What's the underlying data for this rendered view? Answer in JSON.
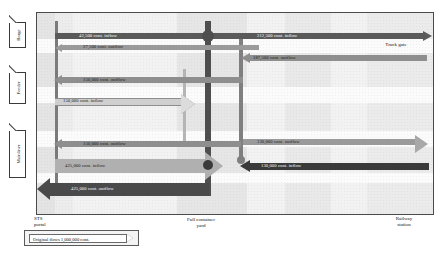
{
  "diagram": {
    "modes": [
      {
        "label": "Barge",
        "name": "barge"
      },
      {
        "label": "Feeder",
        "name": "feeder"
      },
      {
        "label": "Mainliner",
        "name": "mainliner"
      }
    ],
    "zones": [
      {
        "name": "sts-portal",
        "line1": "STS",
        "line2": "portal"
      },
      {
        "name": "full-container-yard",
        "line1": "Full container",
        "line2": "yard"
      },
      {
        "name": "truck-gate",
        "line1": "Truck gate",
        "line2": ""
      },
      {
        "name": "railway-station",
        "line1": "Railway",
        "line2": "station"
      }
    ],
    "flows": [
      {
        "name": "barge-inflow",
        "label": "42,500 cont. inflow",
        "value": 42500,
        "direction": "inflow",
        "mode": "Barge",
        "color": "#5a5a5a"
      },
      {
        "name": "barge-outflow",
        "label": "27,500 cont. outflow",
        "value": 27500,
        "direction": "outflow",
        "mode": "Barge",
        "color": "#9a9a9a"
      },
      {
        "name": "feeder-outflow",
        "label": "150,000 cont. outflow",
        "value": 150000,
        "direction": "outflow",
        "mode": "Feeder",
        "color": "#8e8e8e"
      },
      {
        "name": "feeder-inflow",
        "label": "150,000 cont. inflow",
        "value": 150000,
        "direction": "inflow",
        "mode": "Feeder",
        "color": "#c9c9c9"
      },
      {
        "name": "mainliner-outflow",
        "label": "150,000 cont. outflow",
        "value": 150000,
        "direction": "outflow",
        "mode": "Mainliner",
        "color": "#8e8e8e"
      },
      {
        "name": "mainliner-inflow",
        "label": "425,000 cont. inflow",
        "value": 425000,
        "direction": "inflow",
        "mode": "Mainliner",
        "color": "#b0b0b0"
      },
      {
        "name": "mainliner-outflow-large",
        "label": "425,000 cont. outflow",
        "value": 425000,
        "direction": "outflow",
        "mode": "Mainliner",
        "color": "#4a4a4a"
      },
      {
        "name": "yard-truck-inflow",
        "label": "212,500 cont. inflow",
        "value": 212500,
        "direction": "inflow",
        "mode": "Truck gate",
        "color": "#5a5a5a"
      },
      {
        "name": "yard-truck-outflow",
        "label": "187,500 cont. outflow",
        "value": 187500,
        "direction": "outflow",
        "mode": "Truck gate",
        "color": "#8e8e8e"
      },
      {
        "name": "yard-rail-outflow",
        "label": "130,000 cont. outflow",
        "value": 130000,
        "direction": "outflow",
        "mode": "Railway station",
        "color": "#9a9a9a"
      },
      {
        "name": "yard-rail-inflow",
        "label": "130,000 cont. inflow",
        "value": 130000,
        "direction": "inflow",
        "mode": "Railway station",
        "color": "#3a3a3a"
      }
    ],
    "legend": {
      "name": "scale-legend",
      "label": "Original flows",
      "value": "1,000,000 cont."
    }
  }
}
